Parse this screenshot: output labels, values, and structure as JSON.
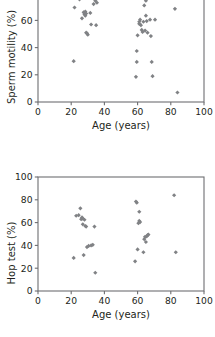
{
  "figure": {
    "type": "scatter-pair",
    "background_color": "#ffffff",
    "marker_color": "#808285",
    "axis_color": "#6d6e71",
    "text_color": "#231f20"
  },
  "charts": [
    {
      "id": "sperm-motility-vs-age",
      "panel_label": "top",
      "ylabel": "Sperm motility (%)",
      "xlabel": "Age (years)"
    },
    {
      "id": "hop-test-vs-age",
      "panel_label": "bottom",
      "ylabel": "Hop test (%)",
      "xlabel": "Age (years)"
    }
  ],
  "chart_data": [
    {
      "type": "scatter",
      "title": "",
      "xlabel": "Age (years)",
      "ylabel": "Sperm motility (%)",
      "xlim": [
        0,
        100
      ],
      "ylim": [
        0,
        100
      ],
      "xticks": [
        0,
        20,
        40,
        60,
        80,
        100
      ],
      "yticks": [
        0,
        20,
        40,
        60,
        80,
        100
      ],
      "xticklabels": [
        "0",
        "20",
        "40",
        "60",
        "80",
        "100"
      ],
      "yticklabels": [
        "0",
        "20",
        "40",
        "60",
        "80",
        "100"
      ],
      "grid": false,
      "legend": false,
      "marker": "diamond",
      "marker_color": "#808285",
      "note": "top panel is vertically cropped: the 100 y-tick label is not visible in the screenshot",
      "series": [
        {
          "name": "subjects",
          "points": [
            [
              21.5,
              30.0
            ],
            [
              22.0,
              69.5
            ],
            [
              24.5,
              78.0
            ],
            [
              25.0,
              75.5
            ],
            [
              25.5,
              77.5
            ],
            [
              26.5,
              61.5
            ],
            [
              27.0,
              79.0
            ],
            [
              27.5,
              66.0
            ],
            [
              28.0,
              64.5
            ],
            [
              28.0,
              65.5
            ],
            [
              28.5,
              63.5
            ],
            [
              28.5,
              66.5
            ],
            [
              29.0,
              65.0
            ],
            [
              29.0,
              51.0
            ],
            [
              29.5,
              50.5
            ],
            [
              30.0,
              49.5
            ],
            [
              30.5,
              88.5
            ],
            [
              31.5,
              65.5
            ],
            [
              32.0,
              57.0
            ],
            [
              33.5,
              72.0
            ],
            [
              34.5,
              74.5
            ],
            [
              35.0,
              56.5
            ],
            [
              35.5,
              73.0
            ],
            [
              59.0,
              18.5
            ],
            [
              59.5,
              29.5
            ],
            [
              59.5,
              37.5
            ],
            [
              60.0,
              49.0
            ],
            [
              60.5,
              77.0
            ],
            [
              61.0,
              59.0
            ],
            [
              61.0,
              57.5
            ],
            [
              61.5,
              60.5
            ],
            [
              62.0,
              56.5
            ],
            [
              62.5,
              53.0
            ],
            [
              63.0,
              51.5
            ],
            [
              63.5,
              59.0
            ],
            [
              64.0,
              71.0
            ],
            [
              64.5,
              52.5
            ],
            [
              65.0,
              74.5
            ],
            [
              65.0,
              63.5
            ],
            [
              65.5,
              59.5
            ],
            [
              66.0,
              51.0
            ],
            [
              67.5,
              60.5
            ],
            [
              68.0,
              48.5
            ],
            [
              68.5,
              29.5
            ],
            [
              69.0,
              19.0
            ],
            [
              70.5,
              60.5
            ],
            [
              82.5,
              68.5
            ],
            [
              84.0,
              7.0
            ]
          ]
        }
      ]
    },
    {
      "type": "scatter",
      "title": "",
      "xlabel": "Age (years)",
      "ylabel": "Hop test (%)",
      "xlim": [
        0,
        100
      ],
      "ylim": [
        0,
        100
      ],
      "xticks": [
        0,
        20,
        40,
        60,
        80,
        100
      ],
      "yticks": [
        0,
        20,
        40,
        60,
        80,
        100
      ],
      "xticklabels": [
        "0",
        "20",
        "40",
        "60",
        "80",
        "100"
      ],
      "yticklabels": [
        "0",
        "20",
        "40",
        "60",
        "80",
        "100"
      ],
      "grid": false,
      "legend": false,
      "marker": "diamond",
      "marker_color": "#808285",
      "series": [
        {
          "name": "subjects",
          "points": [
            [
              21.5,
              29.0
            ],
            [
              23.0,
              66.0
            ],
            [
              24.5,
              66.5
            ],
            [
              25.5,
              72.5
            ],
            [
              26.0,
              63.0
            ],
            [
              26.5,
              64.5
            ],
            [
              27.0,
              63.5
            ],
            [
              27.0,
              58.5
            ],
            [
              27.5,
              31.5
            ],
            [
              28.0,
              62.5
            ],
            [
              28.5,
              57.0
            ],
            [
              29.0,
              56.5
            ],
            [
              29.5,
              38.5
            ],
            [
              30.5,
              39.5
            ],
            [
              32.0,
              40.0
            ],
            [
              33.0,
              40.5
            ],
            [
              34.0,
              56.5
            ],
            [
              34.5,
              16.0
            ],
            [
              58.5,
              26.0
            ],
            [
              59.0,
              78.5
            ],
            [
              59.5,
              77.5
            ],
            [
              60.0,
              36.5
            ],
            [
              60.5,
              59.5
            ],
            [
              61.0,
              61.5
            ],
            [
              61.0,
              69.5
            ],
            [
              61.5,
              60.5
            ],
            [
              63.5,
              34.0
            ],
            [
              64.0,
              45.5
            ],
            [
              64.5,
              47.5
            ],
            [
              65.0,
              43.0
            ],
            [
              65.5,
              48.0
            ],
            [
              66.0,
              49.0
            ],
            [
              66.5,
              49.5
            ],
            [
              82.0,
              84.0
            ],
            [
              83.0,
              34.0
            ]
          ]
        }
      ]
    }
  ]
}
